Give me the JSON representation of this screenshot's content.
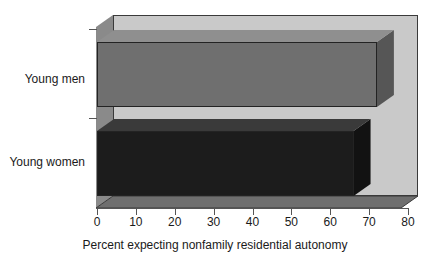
{
  "chart_data": {
    "type": "bar",
    "orientation": "horizontal",
    "style": "3d",
    "title": "",
    "xlabel": "Percent expecting nonfamily residential autonomy",
    "ylabel": "",
    "categories": [
      "Young men",
      "Young women"
    ],
    "values": [
      72,
      66
    ],
    "xlim": [
      0,
      80
    ],
    "xticks": [
      0,
      10,
      20,
      30,
      40,
      50,
      60,
      70,
      80
    ],
    "xtick_labels": [
      "0",
      "10",
      "20",
      "30",
      "40",
      "50",
      "60",
      "70",
      "80"
    ],
    "grid": false,
    "legend": false,
    "series": [
      {
        "name": "Percent expecting nonfamily residential autonomy",
        "values": [
          72,
          66
        ]
      }
    ],
    "bar_colors": [
      "#6f6f6f",
      "#1c1c1c"
    ],
    "plot_background_color": "#c9c9c9",
    "figure_background_color": "#ffffff",
    "axis_color": "#555555"
  },
  "axis": {
    "x_title": "Percent expecting nonfamily residential autonomy",
    "ticks": [
      {
        "label": "0"
      },
      {
        "label": "10"
      },
      {
        "label": "20"
      },
      {
        "label": "30"
      },
      {
        "label": "40"
      },
      {
        "label": "50"
      },
      {
        "label": "60"
      },
      {
        "label": "70"
      },
      {
        "label": "80"
      }
    ]
  },
  "bars": [
    {
      "label": "Young men",
      "value": 72
    },
    {
      "label": "Young women",
      "value": 66
    }
  ]
}
